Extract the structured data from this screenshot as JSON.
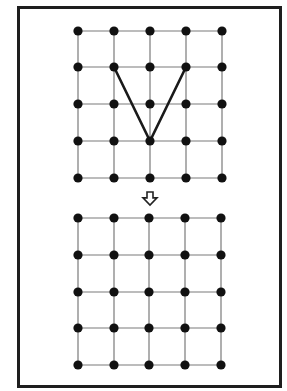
{
  "frame": {
    "x": 18.5,
    "y": 7.5,
    "width": 262,
    "height": 379,
    "stroke": "#1e1e1e",
    "stroke_width": 3
  },
  "colors": {
    "grid_line": "#7a7a7a",
    "dot": "#111111",
    "path": "#1a1a1a",
    "arrow_stroke": "#222222",
    "arrow_fill": "#ffffff",
    "background": "#ffffff"
  },
  "top_grid": {
    "columns_x": [
      78,
      114,
      150,
      186,
      222
    ],
    "rows_y": [
      31,
      67,
      104,
      141,
      178
    ],
    "dot_radius": 4.6,
    "highlighted_path": {
      "description": "V shape drawn through three grid points",
      "points": [
        {
          "col": 1,
          "row": 1
        },
        {
          "col": 2,
          "row": 3
        },
        {
          "col": 3,
          "row": 1
        }
      ],
      "stroke_width": 2.6
    }
  },
  "arrow": {
    "direction": "down",
    "center_x": 150,
    "top_y": 192,
    "bottom_y": 205,
    "shaft_width": 6,
    "head_width": 14
  },
  "bottom_grid": {
    "columns_x": [
      78,
      114,
      149,
      185,
      221
    ],
    "rows_y": [
      218,
      255,
      292,
      328,
      365
    ],
    "dot_radius": 4.6,
    "highlighted_path": null
  }
}
